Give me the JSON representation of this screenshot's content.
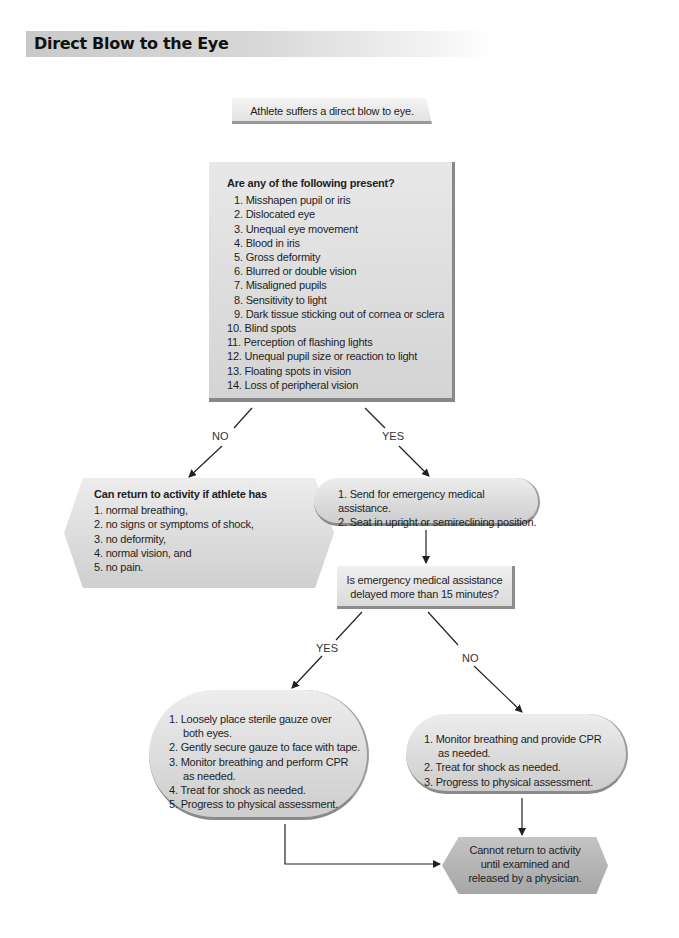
{
  "title": "Direct Blow to the Eye",
  "nodes": {
    "start": {
      "text": "Athlete suffers a direct blow to eye."
    },
    "question": {
      "heading": "Are any of the following present?",
      "items": [
        " 1. Misshapen pupil or iris",
        " 2. Dislocated eye",
        " 3. Unequal eye movement",
        " 4. Blood in iris",
        " 5. Gross deformity",
        " 6. Blurred or double vision",
        " 7. Misaligned pupils",
        " 8. Sensitivity to light",
        " 9. Dark tissue sticking out of cornea or sclera",
        "10. Blind spots",
        "11. Perception of flashing lights",
        "12. Unequal pupil size or reaction to light",
        "13. Floating spots in vision",
        "14. Loss of peripheral vision"
      ]
    },
    "return_activity": {
      "heading": "Can return to activity if athlete has",
      "items": [
        "1. normal breathing,",
        "2. no signs or symptoms of shock,",
        "3. no deformity,",
        "4. normal vision, and",
        "5. no pain."
      ]
    },
    "ems": {
      "items": [
        "1. Send for emergency medical assistance.",
        "2. Seat in upright or semireclining position."
      ]
    },
    "delay_question": {
      "line1": "Is emergency medical assistance",
      "line2": "delayed more than 15 minutes?"
    },
    "delayed_yes": {
      "items": [
        "1. Loosely place sterile gauze over",
        "both eyes.",
        "2. Gently secure gauze to face with tape.",
        "3. Monitor breathing and perform CPR",
        "as needed.",
        "4. Treat for shock as needed.",
        "5. Progress to physical assessment."
      ]
    },
    "delayed_no": {
      "items": [
        "1. Monitor breathing and provide CPR",
        "as needed.",
        "2. Treat for shock as needed.",
        "3. Progress to physical assessment."
      ]
    },
    "end": {
      "line1": "Cannot return to activity",
      "line2": "until examined and",
      "line3": "released by a physician."
    }
  },
  "edge_labels": {
    "q_no": "NO",
    "q_yes": "YES",
    "delay_yes": "YES",
    "delay_no": "NO"
  },
  "colors": {
    "box_light": "#e6e6e6",
    "box_dark": "#a8a8a8",
    "arrow": "#222222"
  }
}
